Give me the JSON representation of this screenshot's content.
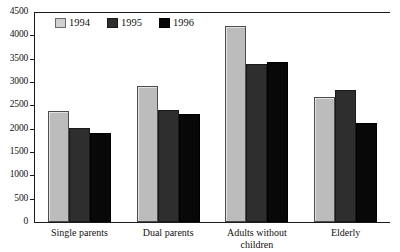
{
  "chart_data": {
    "type": "bar",
    "title": "",
    "xlabel": "",
    "ylabel": "",
    "ylim": [
      0,
      4500
    ],
    "yticks": [
      0,
      500,
      1000,
      1500,
      2000,
      2500,
      3000,
      3500,
      4000,
      4500
    ],
    "ytick_labels": [
      "0",
      "500",
      "1000",
      "1500",
      "2000",
      "2500",
      "3000",
      "3500",
      "4000",
      "4500"
    ],
    "grid": false,
    "legend_position": "top-left-inside",
    "categories": [
      "Single parents",
      "Dual parents",
      "Adults without children",
      "Elderly"
    ],
    "series": [
      {
        "name": "1994",
        "color": "#bcbcbc",
        "values": [
          2380,
          2910,
          4210,
          2680
        ]
      },
      {
        "name": "1995",
        "color": "#2e2e2e",
        "values": [
          2010,
          2400,
          3390,
          2830
        ]
      },
      {
        "name": "1996",
        "color": "#080808",
        "values": [
          1900,
          2310,
          3430,
          2120
        ]
      }
    ]
  },
  "legend": {
    "items": [
      {
        "label": "1994"
      },
      {
        "label": "1995"
      },
      {
        "label": "1996"
      }
    ]
  }
}
